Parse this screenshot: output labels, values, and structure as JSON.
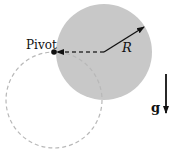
{
  "diagram": {
    "labels": {
      "pivot": "Pivot",
      "radius": "R",
      "gravity": "g"
    },
    "colors": {
      "disk_fill": "#c8c8c8",
      "dashed_circle": "#b8b8b8",
      "arrows": "#111111"
    },
    "elements": [
      {
        "id": "solid-disk",
        "shape": "circle",
        "cx": 104,
        "cy": 52,
        "r": 48
      },
      {
        "id": "dashed-disk",
        "shape": "circle",
        "cx": 54,
        "cy": 100,
        "r": 48,
        "style": "dashed"
      },
      {
        "id": "pivot-point",
        "x": 54,
        "y": 52
      },
      {
        "id": "radius-arrow",
        "from": [
          104,
          52
        ],
        "to": [
          144,
          27
        ]
      },
      {
        "id": "dashed-arrow",
        "from": [
          104,
          52
        ],
        "to": [
          56,
          52
        ]
      },
      {
        "id": "gravity-arrow",
        "from": [
          166,
          74
        ],
        "to": [
          166,
          113
        ]
      }
    ]
  }
}
